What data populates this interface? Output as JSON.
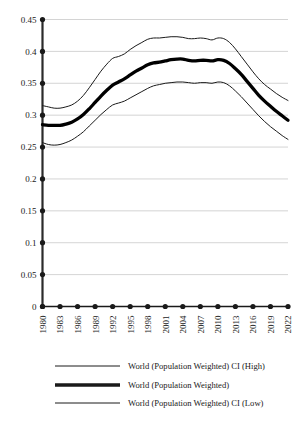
{
  "chart_data": {
    "type": "line",
    "title": "",
    "subtitle": "",
    "xlabel": "",
    "ylabel": "",
    "xlim": [
      1980,
      2022
    ],
    "ylim": [
      0,
      0.45
    ],
    "grid": true,
    "legend_position": "bottom",
    "y_ticks": [
      "0",
      "0.05",
      "0.1",
      "0.15",
      "0.2",
      "0.25",
      "0.3",
      "0.35",
      "0.4",
      "0.45"
    ],
    "y_tick_values": [
      0,
      0.05,
      0.1,
      0.15,
      0.2,
      0.25,
      0.3,
      0.35,
      0.4,
      0.45
    ],
    "x_ticks": [
      "1980",
      "1983",
      "1986",
      "1989",
      "1992",
      "1995",
      "1998",
      "2001",
      "2004",
      "2007",
      "2010",
      "2013",
      "2016",
      "2019",
      "2022"
    ],
    "x_tick_values": [
      1980,
      1983,
      1986,
      1989,
      1992,
      1995,
      1998,
      2001,
      2004,
      2007,
      2010,
      2013,
      2016,
      2019,
      2022
    ],
    "x": [
      1980,
      1981,
      1982,
      1983,
      1984,
      1985,
      1986,
      1987,
      1988,
      1989,
      1990,
      1991,
      1992,
      1993,
      1994,
      1995,
      1996,
      1997,
      1998,
      1999,
      2000,
      2001,
      2002,
      2003,
      2004,
      2005,
      2006,
      2007,
      2008,
      2009,
      2010,
      2011,
      2012,
      2013,
      2014,
      2015,
      2016,
      2017,
      2018,
      2019,
      2020,
      2021,
      2022
    ],
    "series": [
      {
        "name": "World (Population Weighted) CI (High)",
        "style": "thin",
        "color": "#1a1a1a",
        "values": [
          0.315,
          0.313,
          0.311,
          0.311,
          0.313,
          0.316,
          0.322,
          0.331,
          0.343,
          0.356,
          0.369,
          0.38,
          0.389,
          0.392,
          0.396,
          0.403,
          0.409,
          0.414,
          0.419,
          0.421,
          0.421,
          0.422,
          0.423,
          0.423,
          0.422,
          0.42,
          0.42,
          0.421,
          0.42,
          0.418,
          0.421,
          0.42,
          0.414,
          0.404,
          0.392,
          0.38,
          0.368,
          0.357,
          0.348,
          0.341,
          0.334,
          0.328,
          0.323
        ]
      },
      {
        "name": "World (Population Weighted)",
        "style": "thick",
        "color": "#000000",
        "values": [
          0.285,
          0.284,
          0.284,
          0.284,
          0.286,
          0.289,
          0.294,
          0.301,
          0.31,
          0.32,
          0.33,
          0.339,
          0.347,
          0.352,
          0.357,
          0.363,
          0.369,
          0.374,
          0.379,
          0.382,
          0.383,
          0.385,
          0.387,
          0.388,
          0.388,
          0.386,
          0.385,
          0.386,
          0.386,
          0.385,
          0.387,
          0.386,
          0.381,
          0.373,
          0.364,
          0.353,
          0.342,
          0.331,
          0.322,
          0.314,
          0.306,
          0.299,
          0.292
        ]
      },
      {
        "name": "World (Population Weighted) CI (Low)",
        "style": "thin",
        "color": "#1a1a1a",
        "values": [
          0.257,
          0.254,
          0.253,
          0.254,
          0.257,
          0.261,
          0.267,
          0.274,
          0.283,
          0.292,
          0.301,
          0.309,
          0.316,
          0.319,
          0.322,
          0.327,
          0.332,
          0.337,
          0.342,
          0.346,
          0.348,
          0.35,
          0.351,
          0.352,
          0.352,
          0.351,
          0.35,
          0.351,
          0.351,
          0.35,
          0.352,
          0.351,
          0.346,
          0.338,
          0.329,
          0.319,
          0.309,
          0.299,
          0.29,
          0.282,
          0.275,
          0.268,
          0.262
        ]
      }
    ],
    "legend": [
      {
        "label": "World (Population Weighted) CI (High)",
        "style": "thin"
      },
      {
        "label": "World (Population Weighted)",
        "style": "thick"
      },
      {
        "label": "World (Population Weighted) CI (Low)",
        "style": "thin"
      }
    ]
  }
}
